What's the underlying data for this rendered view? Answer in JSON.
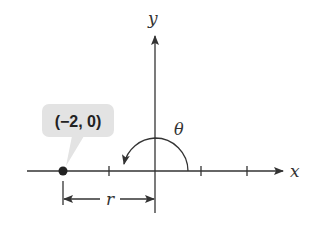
{
  "diagram": {
    "axes": {
      "x_label": "x",
      "y_label": "y"
    },
    "point": {
      "label": "(−2, 0)",
      "x": -2,
      "y": 0
    },
    "angle": {
      "label": "θ",
      "degrees": 180
    },
    "radius": {
      "label": "r",
      "value": 2
    },
    "ticks": [
      -1,
      1,
      2
    ],
    "colors": {
      "stroke": "#333333",
      "callout_fill": "#e3e3e3",
      "point": "#222222"
    }
  }
}
